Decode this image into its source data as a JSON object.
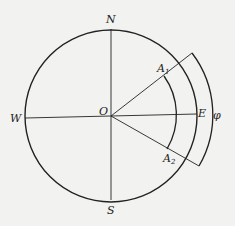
{
  "diagram": {
    "labels": {
      "north": "N",
      "south": "S",
      "west": "W",
      "east": "E",
      "origin": "O",
      "a1_base": "A",
      "a1_sub": "1",
      "a2_base": "A",
      "a2_sub": "2",
      "angle": "φ"
    },
    "colors": {
      "stroke": "#222222",
      "background": "#f2f2f0"
    }
  }
}
